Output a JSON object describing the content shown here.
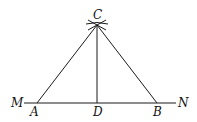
{
  "diagram": {
    "type": "geometric-construction",
    "points": {
      "C": {
        "label": "C"
      },
      "M": {
        "label": "M"
      },
      "N": {
        "label": "N"
      },
      "A": {
        "label": "A"
      },
      "D": {
        "label": "D"
      },
      "B": {
        "label": "B"
      }
    },
    "segments": [
      "MN",
      "AC",
      "BC",
      "CD"
    ],
    "construction_arcs_at": "C",
    "colors": {
      "stroke": "#1a1a1a",
      "background": "#ffffff"
    }
  }
}
